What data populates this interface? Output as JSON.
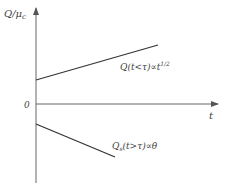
{
  "diagram": {
    "y_axis_label": "Q/μ",
    "y_axis_label_sub": "c",
    "x_axis_label": "t",
    "origin_label": "0",
    "upper_line": {
      "label_main": "Q(t<τ)∝t",
      "label_sup": "1/2",
      "start": [
        36,
        80
      ],
      "end": [
        158,
        45
      ]
    },
    "lower_line": {
      "label_main": "Q",
      "label_sub": "s",
      "label_rest": "(t>τ)∝θ",
      "start": [
        36,
        124
      ],
      "end": [
        115,
        157
      ]
    },
    "colors": {
      "axis": "#555555",
      "line": "#333333",
      "text": "#444444"
    }
  }
}
